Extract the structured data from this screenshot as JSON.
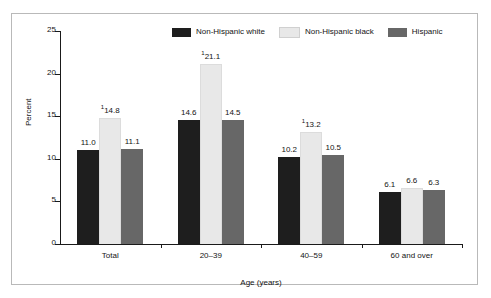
{
  "chart_data": {
    "type": "bar",
    "title": "",
    "xlabel": "Age (years)",
    "ylabel": "Percent",
    "ylim": [
      0,
      25
    ],
    "yticks": [
      0,
      5,
      10,
      15,
      20,
      25
    ],
    "ytick_labels": [
      "0",
      "5",
      "10",
      "15",
      "20",
      "25"
    ],
    "grid": false,
    "legend_position": "top-center",
    "categories": [
      "Total",
      "20–39",
      "40–59",
      "60 and over"
    ],
    "series": [
      {
        "name": "Non-Hispanic white",
        "color": "#1e1e1e",
        "values": [
          11.0,
          14.6,
          10.2,
          6.1
        ],
        "labels": [
          "11.0",
          "14.6",
          "10.2",
          "6.1"
        ],
        "footnotes": [
          "",
          "",
          "",
          ""
        ]
      },
      {
        "name": "Non-Hispanic black",
        "color": "#e8e8e8",
        "values": [
          14.8,
          21.1,
          13.2,
          6.6
        ],
        "labels": [
          "14.8",
          "21.1",
          "13.2",
          "6.6"
        ],
        "footnotes": [
          "1",
          "1",
          "1",
          ""
        ]
      },
      {
        "name": "Hispanic",
        "color": "#676767",
        "values": [
          11.1,
          14.5,
          10.5,
          6.3
        ],
        "labels": [
          "11.1",
          "14.5",
          "10.5",
          "6.3"
        ],
        "footnotes": [
          "",
          "",
          "",
          ""
        ]
      }
    ]
  },
  "legend": {
    "items": [
      {
        "label": "Non-Hispanic white",
        "color": "#1e1e1e"
      },
      {
        "label": "Non-Hispanic black",
        "color": "#e8e8e8"
      },
      {
        "label": "Hispanic",
        "color": "#676767"
      }
    ]
  },
  "axes": {
    "y_title": "Percent",
    "x_title": "Age (years)",
    "y_tick_labels": [
      "25",
      "20",
      "15",
      "10",
      "5",
      "0"
    ],
    "x_tick_labels": [
      "Total",
      "20–39",
      "40–59",
      "60 and over"
    ]
  }
}
